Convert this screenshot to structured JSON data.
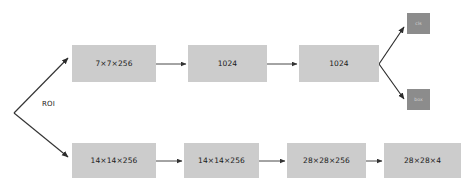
{
  "diagram": {
    "background_color": "#ffffff",
    "node_color": "#cccccc",
    "output_node_color": "#8c8c8c",
    "arrow_color": "#333333",
    "labels": {
      "roi": "ROI"
    },
    "top_branch": [
      {
        "id": "t1",
        "text": "7×7×256"
      },
      {
        "id": "t2",
        "text": "1024"
      },
      {
        "id": "t3",
        "text": "1024"
      }
    ],
    "outputs": [
      {
        "id": "o1",
        "text": "cls"
      },
      {
        "id": "o2",
        "text": "box"
      }
    ],
    "bottom_branch": [
      {
        "id": "b1",
        "text": "14×14×256"
      },
      {
        "id": "b2",
        "text": "14×14×256"
      },
      {
        "id": "b3",
        "text": "28×28×256"
      },
      {
        "id": "b4",
        "text": "28×28×4"
      }
    ]
  }
}
